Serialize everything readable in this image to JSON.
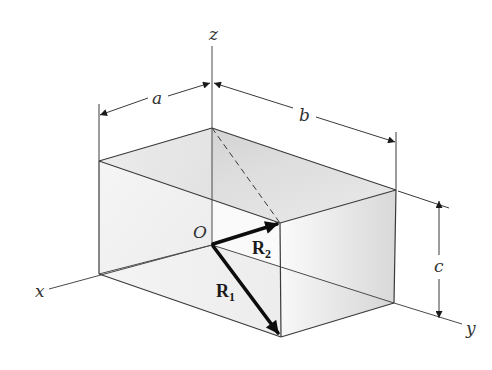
{
  "figure": {
    "colors": {
      "background": "#ffffff",
      "line": "#3a3a3a",
      "vector": "#0d0d0d",
      "face_shade_dark": "#c8c8c8",
      "face_shade_light": "#f2f2f2"
    }
  },
  "axes": {
    "x": {
      "label": "x"
    },
    "y": {
      "label": "y"
    },
    "z": {
      "label": "z"
    }
  },
  "origin": {
    "label": "O"
  },
  "dimensions": {
    "a": {
      "label": "a"
    },
    "b": {
      "label": "b"
    },
    "c": {
      "label": "c"
    }
  },
  "vectors": {
    "R1": {
      "label": "R",
      "subscript": "1"
    },
    "R2": {
      "label": "R",
      "subscript": "2"
    }
  }
}
